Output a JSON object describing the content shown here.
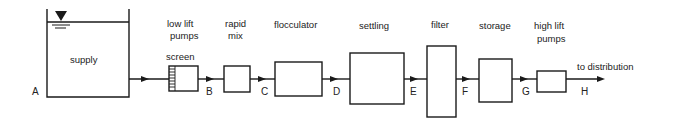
{
  "diagram": {
    "stages": [
      {
        "id": "supply",
        "label": "supply"
      },
      {
        "id": "low_lift_pumps",
        "label_line1": "low lift",
        "label_line2": "pumps",
        "sublabel": "screen"
      },
      {
        "id": "rapid_mix",
        "label_line1": "rapid",
        "label_line2": "mix"
      },
      {
        "id": "flocculator",
        "label": "flocculator"
      },
      {
        "id": "settling",
        "label": "settling"
      },
      {
        "id": "filter",
        "label": "filter"
      },
      {
        "id": "storage",
        "label": "storage"
      },
      {
        "id": "high_lift_pumps",
        "label_line1": "high lift",
        "label_line2": "pumps"
      }
    ],
    "points": [
      "A",
      "B",
      "C",
      "D",
      "E",
      "F",
      "G",
      "H"
    ],
    "outlet_label": "to distribution",
    "line_color": "#1a1a1a"
  }
}
